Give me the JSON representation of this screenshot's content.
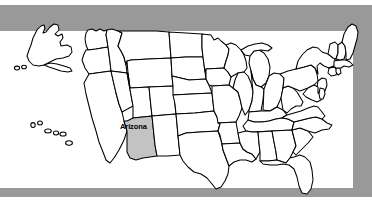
{
  "figure": {
    "kind": "us-states-map",
    "background_color": "#999999",
    "canvas_color": "#ffffff",
    "outline_color": "#000000",
    "highlight_color": "#c3c3c3"
  },
  "labels": {
    "arizona": "Arizona"
  },
  "highlighted_states": [
    "Arizona"
  ],
  "insets": {
    "alaska": "Alaska",
    "hawaii": "Hawaii"
  }
}
